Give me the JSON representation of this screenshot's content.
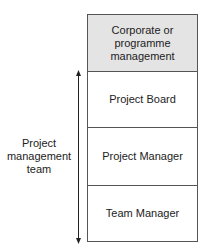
{
  "diagram": {
    "levels": [
      {
        "label": "Corporate or programme management",
        "lines": [
          "Corporate or",
          "programme",
          "management"
        ],
        "fill": "#e4e4e4"
      },
      {
        "label": "Project Board",
        "fill": "#ffffff"
      },
      {
        "label": "Project Manager",
        "fill": "#ffffff"
      },
      {
        "label": "Team Manager",
        "fill": "#ffffff"
      }
    ],
    "side_label": {
      "lines": [
        "Project",
        "management",
        "team"
      ]
    },
    "arrow": {
      "direction": "bidirectional-vertical",
      "color": "#222222"
    }
  }
}
